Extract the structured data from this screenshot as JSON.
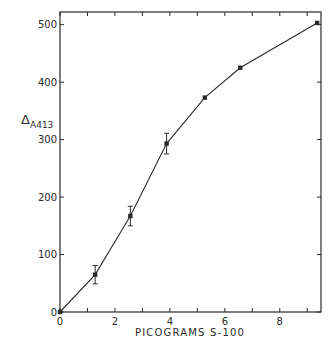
{
  "chart_data": {
    "type": "line",
    "title": "",
    "xlabel": "PICOGRAMS S-100",
    "ylabel": "Δ",
    "ylabel_subscript": "A413",
    "xlim": [
      0,
      9.5
    ],
    "ylim": [
      0,
      522
    ],
    "xticks": [
      0,
      2,
      4,
      6,
      8
    ],
    "xticks_minor": [
      1,
      3,
      5,
      7,
      9
    ],
    "yticks": [
      0,
      100,
      200,
      300,
      400,
      500
    ],
    "grid": false,
    "legend": null,
    "box": true,
    "series": [
      {
        "name": "S-100 response",
        "marker": "square",
        "x": [
          0,
          1.28,
          2.56,
          3.88,
          5.27,
          6.56,
          9.36
        ],
        "y": [
          0,
          65,
          167,
          293,
          373,
          425,
          503
        ],
        "error": [
          0,
          16,
          17,
          18,
          0,
          0,
          0
        ]
      }
    ]
  },
  "colors": {
    "ink": "#2a2a2a",
    "background": "#ffffff"
  },
  "labels": {
    "x_axis_title": "PICOGRAMS S-100",
    "y_axis_symbol": "Δ",
    "y_axis_subscript": "A413"
  }
}
